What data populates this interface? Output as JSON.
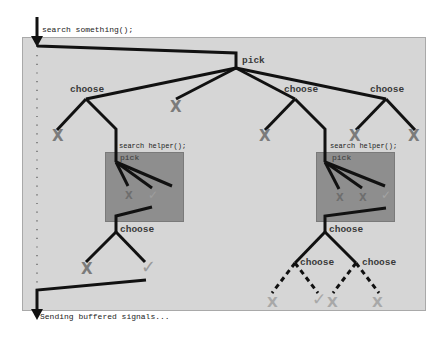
{
  "labels": {
    "entry": "search something();",
    "exit": "Sending buffered signals...",
    "root": "pick",
    "helper_call": "search helper();",
    "helper_pick": "pick",
    "choose": "choose"
  },
  "colors": {
    "panel": "#d6d6d6",
    "helper_box": "#8e8e8e",
    "edge": "#111111",
    "fail_mark": "#7b7b7b",
    "success_mark": "#9a9a9a",
    "speculative_mark": "#a8a8a8"
  },
  "marks": {
    "fail": "X",
    "success": "✓"
  },
  "tree": {
    "root": {
      "label": "pick",
      "children": [
        {
          "label": "choose",
          "children": [
            {
              "result": "X"
            },
            {
              "label": "search helper();",
              "children": [
                {
                  "label": "pick",
                  "children": [
                    {
                      "result": "X"
                    },
                    {
                      "result": "✓"
                    }
                  ]
                },
                {
                  "label": "choose",
                  "children": [
                    {
                      "result": "X"
                    },
                    {
                      "result": "✓"
                    }
                  ]
                }
              ]
            }
          ]
        },
        {
          "result": "X"
        },
        {
          "label": "choose",
          "children": [
            {
              "result": "X"
            },
            {
              "label": "search helper();",
              "children": [
                {
                  "label": "pick",
                  "children": [
                    {
                      "result": "X"
                    },
                    {
                      "result": "X"
                    },
                    {
                      "result": "✓"
                    }
                  ]
                },
                {
                  "label": "choose",
                  "children": [
                    {
                      "label": "choose",
                      "speculative": true,
                      "children": [
                        {
                          "result": "X"
                        },
                        {
                          "result": "✓"
                        }
                      ]
                    },
                    {
                      "label": "choose",
                      "speculative": true,
                      "children": [
                        {
                          "result": "X"
                        },
                        {
                          "result": "X"
                        }
                      ]
                    }
                  ]
                }
              ]
            }
          ]
        },
        {
          "label": "choose",
          "children": [
            {
              "result": "X"
            },
            {
              "result": "X"
            }
          ]
        }
      ]
    }
  }
}
